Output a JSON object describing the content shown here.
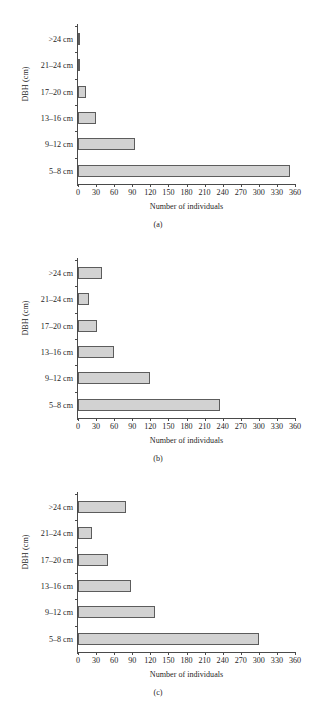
{
  "figure": {
    "axis_titles": {
      "y": "DBH (cm)",
      "x": "Number of individuals"
    },
    "categories": [
      "5–8 cm",
      "9–12 cm",
      "13–16 cm",
      "17–20 cm",
      "21–24 cm",
      ">24 cm"
    ],
    "xticks": [
      "0",
      "30",
      "60",
      "90",
      "120",
      "150",
      "180",
      "210",
      "240",
      "270",
      "300",
      "330",
      "360"
    ],
    "captions": [
      "(a)",
      "(b)",
      "(c)"
    ],
    "bar_fill": "#d2d2d2",
    "bar_stroke": "#5c5c5c",
    "axis_color": "#4a4a4a"
  },
  "chart_data": [
    {
      "type": "bar",
      "title": "(a)",
      "orientation": "horizontal",
      "categories": [
        ">24 cm",
        "21–24 cm",
        "17–20 cm",
        "13–16 cm",
        "9–12 cm",
        "5–8 cm"
      ],
      "values": [
        4,
        3,
        14,
        30,
        94,
        352
      ],
      "xlabel": "Number of individuals",
      "ylabel": "DBH (cm)",
      "xlim": [
        0,
        360
      ],
      "xtick_step": 30,
      "grid": false,
      "legend": null
    },
    {
      "type": "bar",
      "title": "(b)",
      "orientation": "horizontal",
      "categories": [
        ">24 cm",
        "21–24 cm",
        "17–20 cm",
        "13–16 cm",
        "9–12 cm",
        "5–8 cm"
      ],
      "values": [
        40,
        18,
        31,
        60,
        120,
        236
      ],
      "xlabel": "Number of individuals",
      "ylabel": "DBH (cm)",
      "xlim": [
        0,
        360
      ],
      "xtick_step": 30,
      "grid": false,
      "legend": null
    },
    {
      "type": "bar",
      "title": "(c)",
      "orientation": "horizontal",
      "categories": [
        ">24 cm",
        "21–24 cm",
        "17–20 cm",
        "13–16 cm",
        "9–12 cm",
        "5–8 cm"
      ],
      "values": [
        79,
        23,
        50,
        88,
        127,
        300
      ],
      "xlabel": "Number of individuals",
      "ylabel": "DBH (cm)",
      "xlim": [
        0,
        360
      ],
      "xtick_step": 30,
      "grid": false,
      "legend": null
    }
  ]
}
